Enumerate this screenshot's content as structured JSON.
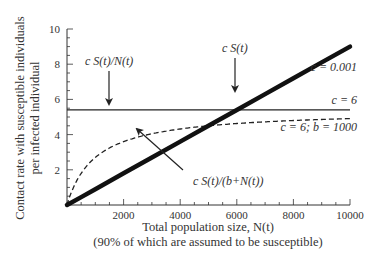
{
  "chart_data": {
    "type": "line",
    "title": "",
    "xlabel": "Total population size, N(t)",
    "xlabel_sub": "(90% of which are assumed to be susceptible)",
    "ylabel_line1": "Contact rate with susceptible individuals",
    "ylabel_line2": "per infected individual",
    "xlim": [
      0,
      10000
    ],
    "ylim": [
      0,
      10
    ],
    "x_ticks": [
      2000,
      4000,
      6000,
      8000,
      10000
    ],
    "x_tick_labels": [
      "2000",
      "4000",
      "6000",
      "8000",
      "10000"
    ],
    "y_ticks": [
      2,
      4,
      6,
      8,
      10
    ],
    "y_tick_labels": [
      "2",
      "4",
      "6",
      "8",
      "10"
    ],
    "grid": false,
    "x": [
      0,
      500,
      1000,
      2000,
      3000,
      4000,
      5000,
      6000,
      7000,
      8000,
      9000,
      10000
    ],
    "series": [
      {
        "name": "c S(t)",
        "param_label": "c = 0.001",
        "style": "thick-solid",
        "values": [
          0,
          0.45,
          0.9,
          1.8,
          2.7,
          3.6,
          4.5,
          5.4,
          6.3,
          7.2,
          8.1,
          9.0
        ]
      },
      {
        "name": "c S(t)/N(t)",
        "param_label": "c = 6",
        "style": "thin-solid",
        "values": [
          5.4,
          5.4,
          5.4,
          5.4,
          5.4,
          5.4,
          5.4,
          5.4,
          5.4,
          5.4,
          5.4,
          5.4
        ]
      },
      {
        "name": "c S(t)/(b+N(t))",
        "param_label": "c = 6; b = 1000",
        "style": "dashed",
        "values": [
          0,
          1.8,
          2.7,
          3.6,
          4.05,
          4.32,
          4.5,
          4.63,
          4.73,
          4.8,
          4.86,
          4.91
        ]
      }
    ],
    "annotations": [
      {
        "text": "c S(t)/N(t)",
        "arrow_to": [
          1500,
          5.4
        ]
      },
      {
        "text": "c S(t)",
        "arrow_to": [
          5600,
          5.9
        ]
      },
      {
        "text": "c S(t)/(b+N(t))",
        "arrow_to": [
          2500,
          4.5
        ]
      },
      {
        "text": "c = 0.001"
      },
      {
        "text": "c = 6"
      },
      {
        "text": "c = 6; b = 1000"
      }
    ]
  },
  "labels": {
    "ann_density": "c S(t)/N(t)",
    "ann_frequency": "c S(t)",
    "ann_saturating": "c S(t)/(b+N(t))",
    "param_thick": "c = 0.001",
    "param_flat": "c = 6",
    "param_dashed": "c = 6; b = 1000"
  }
}
